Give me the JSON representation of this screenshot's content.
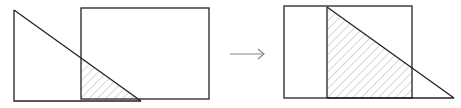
{
  "diagram": {
    "colors": {
      "stroke": "#222222",
      "hatch": "#b0b0b0",
      "arrow": "#888888",
      "background": "#ffffff"
    },
    "panels": [
      {
        "name": "before",
        "rectangle": {
          "x": 81,
          "y": 8,
          "width": 128,
          "height": 91
        },
        "triangle": {
          "apex": [
            14,
            10
          ],
          "right_angle": [
            14,
            101
          ],
          "far": [
            141,
            100
          ]
        },
        "overlap_polygon": [
          [
            81,
            58
          ],
          [
            81,
            100
          ],
          [
            141,
            100
          ]
        ]
      },
      {
        "name": "after",
        "rectangle": {
          "x": 284,
          "y": 6,
          "width": 128,
          "height": 92
        },
        "triangle": {
          "apex": [
            327,
            7
          ],
          "right_angle": [
            327,
            98
          ],
          "far": [
            454,
            97
          ]
        },
        "overlap_polygon": [
          [
            327,
            7
          ],
          [
            327,
            98
          ],
          [
            412,
            98
          ],
          [
            412,
            67
          ]
        ]
      }
    ],
    "arrow": {
      "from": [
        230,
        54
      ],
      "to": [
        264,
        54
      ],
      "label": "→"
    }
  }
}
